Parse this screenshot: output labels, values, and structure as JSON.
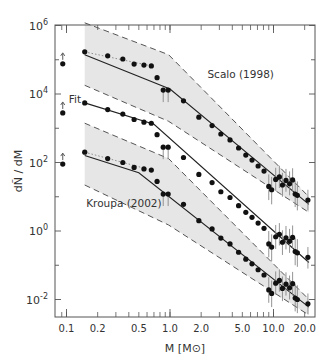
{
  "chart_data": {
    "type": "scatter",
    "title": "",
    "xlabel": "M [M⊙]",
    "ylabel": "dÑ / dM",
    "xscale": "log",
    "yscale": "log",
    "xlim": [
      0.085,
      25
    ],
    "ylim": [
      0.004,
      1000000
    ],
    "grid": false,
    "legend": "none",
    "x_ticks": [
      {
        "value": 0.1,
        "label": "0.1"
      },
      {
        "value": 0.2,
        "label": "0.2"
      },
      {
        "value": 0.5,
        "label": "0.5"
      },
      {
        "value": 1.0,
        "label": "1.0"
      },
      {
        "value": 2.0,
        "label": "2.0"
      },
      {
        "value": 5.0,
        "label": "5.0"
      },
      {
        "value": 10.0,
        "label": "10.0"
      },
      {
        "value": 20.0,
        "label": "20.0"
      }
    ],
    "y_ticks": [
      {
        "exp": 6,
        "label": "10",
        "sup": "6"
      },
      {
        "exp": 4,
        "label": "10",
        "sup": "4"
      },
      {
        "exp": 2,
        "label": "10",
        "sup": "2"
      },
      {
        "exp": 0,
        "label": "10",
        "sup": "0"
      },
      {
        "exp": -2,
        "label": "10",
        "sup": "-2"
      }
    ],
    "annotations": [
      {
        "text": "Scalo (1998)",
        "x": 2.3,
        "y": 30000
      },
      {
        "text": "Fit",
        "x": 0.105,
        "y": 5500
      },
      {
        "text": "Kroupa (2002)",
        "x": 0.155,
        "y": 5
      }
    ],
    "series": [
      {
        "name": "Scalo (1998)",
        "lower_limit_point": {
          "x": 0.092,
          "y": 76000
        },
        "points": [
          {
            "x": 0.15,
            "y": 170000
          },
          {
            "x": 0.25,
            "y": 130000
          },
          {
            "x": 0.35,
            "y": 105000
          },
          {
            "x": 0.45,
            "y": 75000
          },
          {
            "x": 0.56,
            "y": 70000
          },
          {
            "x": 0.66,
            "y": 66000
          },
          {
            "x": 0.75,
            "y": 30000
          },
          {
            "x": 0.86,
            "y": 13000
          },
          {
            "x": 0.96,
            "y": 13000
          },
          {
            "x": 1.35,
            "y": 6300
          },
          {
            "x": 1.9,
            "y": 2100
          },
          {
            "x": 2.55,
            "y": 1200
          },
          {
            "x": 3.1,
            "y": 680
          },
          {
            "x": 3.8,
            "y": 455
          },
          {
            "x": 4.6,
            "y": 265
          },
          {
            "x": 5.4,
            "y": 165
          },
          {
            "x": 6.2,
            "y": 118
          },
          {
            "x": 7.1,
            "y": 79
          },
          {
            "x": 8.1,
            "y": 56
          },
          {
            "x": 9.0,
            "y": 20,
            "err": [
              8,
              45
            ]
          },
          {
            "x": 9.6,
            "y": 16,
            "err": [
              6,
              38
            ]
          },
          {
            "x": 10.5,
            "y": 32,
            "err": [
              15,
              70
            ]
          },
          {
            "x": 11.4,
            "y": 38,
            "err": [
              18,
              80
            ]
          },
          {
            "x": 12.2,
            "y": 22,
            "err": [
              10,
              50
            ]
          },
          {
            "x": 13.2,
            "y": 30,
            "err": [
              14,
              65
            ]
          },
          {
            "x": 14.3,
            "y": 24,
            "err": [
              11,
              55
            ]
          },
          {
            "x": 15.3,
            "y": 31,
            "err": [
              14,
              68
            ]
          },
          {
            "x": 16.2,
            "y": 12,
            "err": [
              5,
              30
            ]
          },
          {
            "x": 17.0,
            "y": 11,
            "err": [
              4,
              28
            ]
          },
          {
            "x": 21.5,
            "y": 8,
            "err": [
              4,
              16
            ]
          }
        ],
        "model_line": [
          {
            "x": 0.15,
            "y": 140000
          },
          {
            "x": 1.0,
            "y": 14000
          },
          {
            "x": 22,
            "y": 6
          }
        ],
        "band_upper": [
          {
            "x": 0.15,
            "y": 1200000
          },
          {
            "x": 0.97,
            "y": 140000
          },
          {
            "x": 22,
            "y": 10
          }
        ],
        "band_lower": [
          {
            "x": 0.15,
            "y": 18000
          },
          {
            "x": 0.97,
            "y": 1600
          },
          {
            "x": 22,
            "y": 3.5
          }
        ],
        "dotted_line": [
          {
            "x": 0.15,
            "y": 170000
          },
          {
            "x": 0.66,
            "y": 66000
          }
        ]
      },
      {
        "name": "Fit",
        "lower_limit_point": {
          "x": 0.092,
          "y": 2800
        },
        "points": [
          {
            "x": 0.15,
            "y": 5500
          },
          {
            "x": 0.25,
            "y": 3500
          },
          {
            "x": 0.35,
            "y": 2600
          },
          {
            "x": 0.45,
            "y": 1800
          },
          {
            "x": 0.56,
            "y": 1500
          },
          {
            "x": 0.66,
            "y": 1400
          },
          {
            "x": 0.75,
            "y": 650
          },
          {
            "x": 0.86,
            "y": 280
          },
          {
            "x": 0.96,
            "y": 280
          },
          {
            "x": 1.35,
            "y": 140
          },
          {
            "x": 1.9,
            "y": 45
          },
          {
            "x": 2.55,
            "y": 26
          },
          {
            "x": 3.1,
            "y": 14
          },
          {
            "x": 3.8,
            "y": 9.5
          },
          {
            "x": 4.6,
            "y": 5.5
          },
          {
            "x": 5.4,
            "y": 3.5
          },
          {
            "x": 6.2,
            "y": 2.5
          },
          {
            "x": 7.1,
            "y": 1.7
          },
          {
            "x": 8.1,
            "y": 1.2
          },
          {
            "x": 9.0,
            "y": 0.42,
            "err": [
              0.17,
              1.0
            ]
          },
          {
            "x": 9.6,
            "y": 0.34,
            "err": [
              0.13,
              0.8
            ]
          },
          {
            "x": 10.5,
            "y": 0.68,
            "err": [
              0.3,
              1.5
            ]
          },
          {
            "x": 11.4,
            "y": 0.8,
            "err": [
              0.38,
              1.7
            ]
          },
          {
            "x": 12.2,
            "y": 0.47,
            "err": [
              0.2,
              1.05
            ]
          },
          {
            "x": 13.2,
            "y": 0.63,
            "err": [
              0.29,
              1.4
            ]
          },
          {
            "x": 14.3,
            "y": 0.5,
            "err": [
              0.23,
              1.15
            ]
          },
          {
            "x": 15.3,
            "y": 0.65,
            "err": [
              0.3,
              1.45
            ]
          },
          {
            "x": 16.2,
            "y": 0.25,
            "err": [
              0.1,
              0.63
            ]
          },
          {
            "x": 17.0,
            "y": 0.23,
            "err": [
              0.09,
              0.58
            ]
          },
          {
            "x": 21.5,
            "y": 0.17,
            "err": [
              0.08,
              0.34
            ]
          }
        ],
        "model_line": [
          {
            "x": 0.15,
            "y": 5500
          },
          {
            "x": 0.7,
            "y": 1300
          },
          {
            "x": 22,
            "y": 0.12
          }
        ]
      },
      {
        "name": "Kroupa (2002)",
        "lower_limit_point": {
          "x": 0.092,
          "y": 90
        },
        "points": [
          {
            "x": 0.15,
            "y": 200
          },
          {
            "x": 0.25,
            "y": 130
          },
          {
            "x": 0.35,
            "y": 100
          },
          {
            "x": 0.45,
            "y": 72
          },
          {
            "x": 0.56,
            "y": 65
          },
          {
            "x": 0.66,
            "y": 60
          },
          {
            "x": 0.75,
            "y": 28
          },
          {
            "x": 0.86,
            "y": 12
          },
          {
            "x": 0.96,
            "y": 12
          },
          {
            "x": 1.35,
            "y": 6
          },
          {
            "x": 1.9,
            "y": 2
          },
          {
            "x": 2.55,
            "y": 1.15
          },
          {
            "x": 3.1,
            "y": 0.62
          },
          {
            "x": 3.8,
            "y": 0.42
          },
          {
            "x": 4.6,
            "y": 0.24
          },
          {
            "x": 5.4,
            "y": 0.15
          },
          {
            "x": 6.2,
            "y": 0.11
          },
          {
            "x": 7.1,
            "y": 0.074
          },
          {
            "x": 8.1,
            "y": 0.052
          },
          {
            "x": 9.0,
            "y": 0.019,
            "err": [
              0.008,
              0.045
            ]
          },
          {
            "x": 9.6,
            "y": 0.015,
            "err": [
              0.006,
              0.036
            ]
          },
          {
            "x": 10.5,
            "y": 0.03,
            "err": [
              0.014,
              0.066
            ]
          },
          {
            "x": 11.4,
            "y": 0.036,
            "err": [
              0.017,
              0.076
            ]
          },
          {
            "x": 12.2,
            "y": 0.021,
            "err": [
              0.009,
              0.047
            ]
          },
          {
            "x": 13.2,
            "y": 0.028,
            "err": [
              0.013,
              0.062
            ]
          },
          {
            "x": 14.3,
            "y": 0.022,
            "err": [
              0.01,
              0.05
            ]
          },
          {
            "x": 15.3,
            "y": 0.029,
            "err": [
              0.013,
              0.064
            ]
          },
          {
            "x": 16.2,
            "y": 0.011,
            "err": [
              0.0045,
              0.028
            ]
          },
          {
            "x": 17.0,
            "y": 0.01,
            "err": [
              0.004,
              0.026
            ]
          },
          {
            "x": 21.5,
            "y": 0.0075,
            "err": [
              0.0037,
              0.015
            ]
          }
        ],
        "model_line": [
          {
            "x": 0.15,
            "y": 160
          },
          {
            "x": 0.5,
            "y": 50
          },
          {
            "x": 22,
            "y": 0.006
          }
        ],
        "band_upper": [
          {
            "x": 0.15,
            "y": 1400
          },
          {
            "x": 0.97,
            "y": 130
          },
          {
            "x": 22,
            "y": 0.01
          }
        ],
        "band_lower": [
          {
            "x": 0.15,
            "y": 22
          },
          {
            "x": 0.97,
            "y": 1.5
          },
          {
            "x": 22,
            "y": 0.0035
          }
        ],
        "dotted_line": [
          {
            "x": 0.15,
            "y": 200
          },
          {
            "x": 0.66,
            "y": 60
          }
        ]
      }
    ]
  },
  "colors": {
    "frame": "#555555",
    "point": "#111111",
    "line": "#222222",
    "band_fill": "#e6e6e6",
    "band_edge": "#555555",
    "errorbar": "#888888",
    "text": "#333333"
  }
}
